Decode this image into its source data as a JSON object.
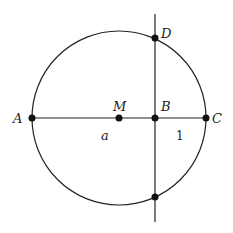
{
  "diagram": {
    "type": "geometry",
    "stroke_color": "#222222",
    "background": "#ffffff",
    "points": [
      {
        "id": "A",
        "label": "A"
      },
      {
        "id": "M",
        "label": "M"
      },
      {
        "id": "B",
        "label": "B"
      },
      {
        "id": "C",
        "label": "C"
      },
      {
        "id": "D",
        "label": "D"
      },
      {
        "id": "E",
        "label": ""
      }
    ],
    "segment_labels": [
      {
        "id": "AB",
        "label": "a"
      },
      {
        "id": "BC",
        "label": "1"
      }
    ]
  }
}
